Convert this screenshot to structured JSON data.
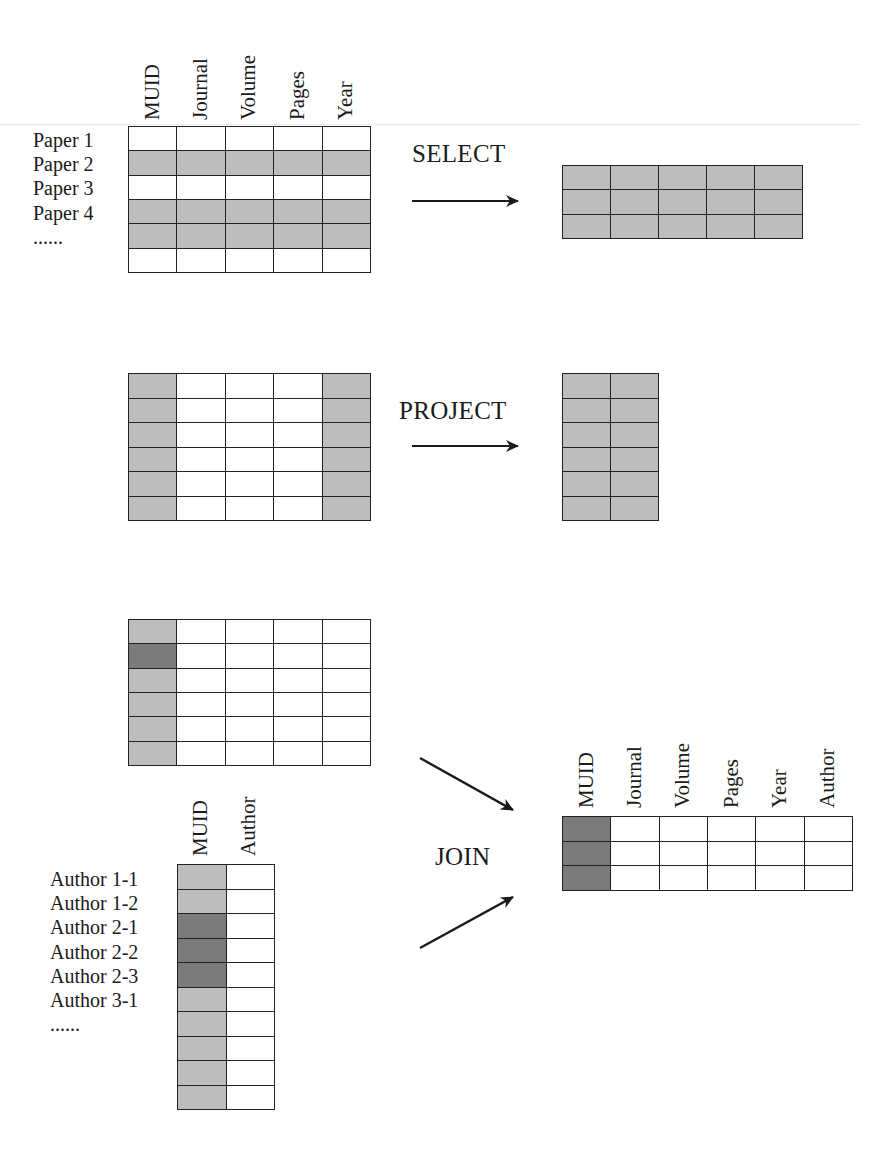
{
  "diagram": {
    "colors": {
      "light_gray": "#bdbdbd",
      "dark_gray": "#7b7b7b",
      "line": "#222222"
    },
    "paper_table": {
      "columns": [
        "MUID",
        "Journal",
        "Volume",
        "Pages",
        "Year"
      ],
      "row_labels": [
        "Paper 1",
        "Paper 2",
        "Paper 3",
        "Paper 4",
        "......"
      ],
      "row_count": 6
    },
    "select": {
      "label": "SELECT",
      "input_highlight_rows": [
        2,
        4,
        5
      ],
      "result_rows": 3,
      "result_columns": 5
    },
    "project": {
      "label": "PROJECT",
      "input_highlight_columns": [
        "MUID",
        "Year"
      ],
      "result_rows": 6,
      "result_columns": 2
    },
    "author_table": {
      "columns": [
        "MUID",
        "Author"
      ],
      "row_labels": [
        "Author 1-1",
        "Author 1-2",
        "Author 2-1",
        "Author 2-2",
        "Author 2-3",
        "Author 3-1",
        "......"
      ],
      "row_count": 10,
      "muid_shading": [
        "light",
        "light",
        "dark",
        "dark",
        "dark",
        "light",
        "light",
        "light",
        "light",
        "light"
      ]
    },
    "join": {
      "label": "JOIN",
      "paper_muid_shading": [
        "light",
        "dark",
        "light",
        "light",
        "light",
        "light"
      ],
      "result_columns": [
        "MUID",
        "Journal",
        "Volume",
        "Pages",
        "Year",
        "Author"
      ],
      "result_rows": 3
    }
  }
}
